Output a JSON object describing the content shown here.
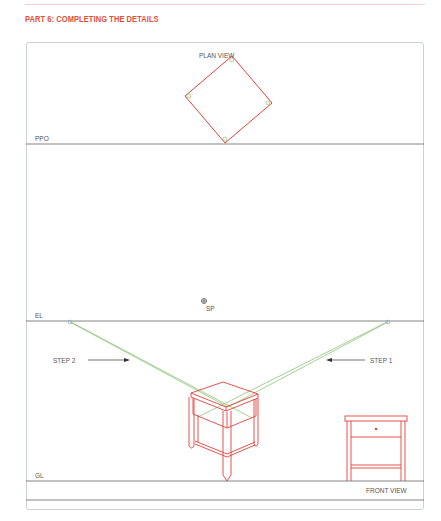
{
  "header": {
    "title": "PART 6: COMPLETING THE DETAILS",
    "accent_color": "#e2503b"
  },
  "drawing": {
    "labels": {
      "plan_view": "PLAN VIEW",
      "ppo": "PPO",
      "sp": "SP",
      "el": "EL",
      "gl": "GL",
      "step_1": "STEP 1",
      "step_2": "STEP 2",
      "front_view": "FRONT VIEW"
    },
    "colors": {
      "object_lines": "#e5403a",
      "construction_lines": "#8fc47a",
      "ground_lines": "#666666",
      "frame_border": "#c9d3d6"
    }
  }
}
